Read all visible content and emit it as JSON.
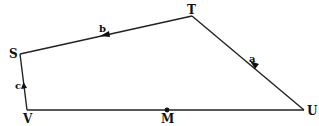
{
  "diagram": {
    "type": "quadrilateral",
    "vertices": [
      {
        "id": "T",
        "label": "T",
        "x": 192,
        "y": 16
      },
      {
        "id": "S",
        "label": "S",
        "x": 20,
        "y": 54
      },
      {
        "id": "V",
        "label": "V",
        "x": 27,
        "y": 110
      },
      {
        "id": "U",
        "label": "U",
        "x": 304,
        "y": 110
      }
    ],
    "point": {
      "id": "M",
      "label": "M",
      "x": 167,
      "y": 110,
      "note": "point on segment VU"
    },
    "vectors": [
      {
        "id": "a",
        "label": "a",
        "from": "U",
        "to": "T"
      },
      {
        "id": "b",
        "label": "b",
        "from": "T",
        "to": "S"
      },
      {
        "id": "c",
        "label": "c",
        "from": "V",
        "to": "S"
      }
    ],
    "stroke_color": "#222222"
  }
}
